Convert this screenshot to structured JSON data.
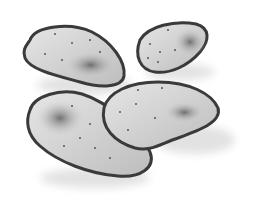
{
  "image": {
    "description": "Grayscale illustration of four flat oval slices (chips) with speckles",
    "background": "#ffffff",
    "colors": {
      "outline": "#3a3a3a",
      "fill": "#d4d4d4",
      "light": "#e8e8e8",
      "shade": "#6e6e6e",
      "shadow": "#e6e6e6",
      "speck": "#555555"
    },
    "objects": [
      {
        "name": "chip-top-left"
      },
      {
        "name": "chip-top-right"
      },
      {
        "name": "chip-bottom-left"
      },
      {
        "name": "chip-bottom-right"
      }
    ]
  }
}
